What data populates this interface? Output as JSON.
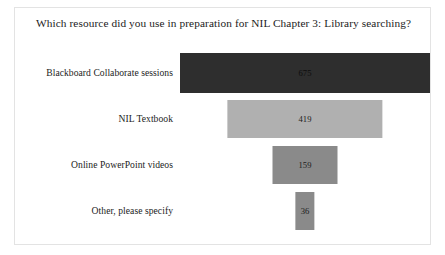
{
  "chart_data": {
    "type": "bar",
    "orientation": "horizontal",
    "alignment": "centered",
    "title": "Which resource did you use in preparation for NIL Chapter 3: Library searching?",
    "xlabel": "",
    "ylabel": "",
    "grid": false,
    "legend": false,
    "categories": [
      "Blackboard Collaborate sessions",
      "NIL Textbook",
      "Online PowerPoint videos",
      "Other, please specify"
    ],
    "values": [
      675,
      419,
      159,
      36
    ],
    "value_labels": [
      "675",
      "419",
      "159",
      "36"
    ],
    "bar_colors": [
      "#2e2e2e",
      "#b0b0b0",
      "#8a8a8a",
      "#8a8a8a"
    ],
    "xlim": [
      0,
      675
    ]
  },
  "bars": [
    {
      "label": "Blackboard Collaborate sessions",
      "value_label": "675",
      "width_pct": 100,
      "color": "#2e2e2e",
      "value_class": "v-dark"
    },
    {
      "label": "NIL Textbook",
      "value_label": "419",
      "width_pct": 62.1,
      "color": "#b0b0b0",
      "value_class": "v-light"
    },
    {
      "label": "Online PowerPoint videos",
      "value_label": "159",
      "width_pct": 26.0,
      "color": "#8a8a8a",
      "value_class": "v-light"
    },
    {
      "label": "Other, please specify",
      "value_label": "36",
      "width_pct": 7.7,
      "color": "#8a8a8a",
      "value_class": "v-light"
    }
  ]
}
